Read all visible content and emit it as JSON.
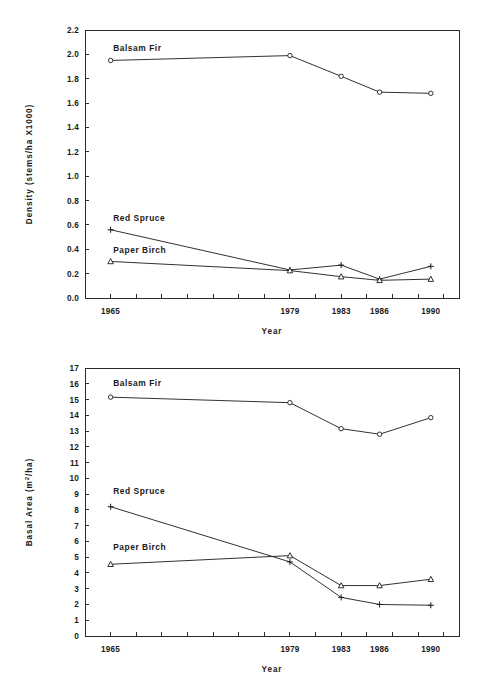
{
  "figures": [
    {
      "id": "density",
      "name": "density-chart",
      "ylabel": "Density (stems/ha X1000)",
      "xlabel": "Year"
    },
    {
      "id": "basal-area",
      "name": "basal-area-chart",
      "ylabel": "Basal Area (m²/ha)",
      "xlabel": "Year"
    }
  ],
  "chart_data": [
    {
      "type": "line",
      "title": "",
      "xlabel": "Year",
      "ylabel": "Density (stems/ha X1000)",
      "categories": [
        "1965",
        "1979",
        "1983",
        "1986",
        "1990"
      ],
      "x_positions": [
        1,
        8,
        10,
        11.5,
        13.5
      ],
      "xlim": [
        0,
        14.6
      ],
      "ylim": [
        0.0,
        2.2
      ],
      "yticks": [
        "0.0",
        "0.2",
        "0.4",
        "0.6",
        "0.8",
        "1.0",
        "1.2",
        "1.4",
        "1.6",
        "1.8",
        "2.0",
        "2.2"
      ],
      "ytick_values": [
        0.0,
        0.2,
        0.4,
        0.6,
        0.8,
        1.0,
        1.2,
        1.4,
        1.6,
        1.8,
        2.0,
        2.2
      ],
      "grid": false,
      "legend_position": "inline-left",
      "series": [
        {
          "name": "Balsam Fir",
          "marker": "circle",
          "values": [
            1.95,
            1.99,
            1.82,
            1.69,
            1.68
          ],
          "label_x": 1.1,
          "label_y": 2.03
        },
        {
          "name": "Red Spruce",
          "marker": "plus",
          "values": [
            0.56,
            0.23,
            0.27,
            0.155,
            0.26
          ],
          "label_x": 1.1,
          "label_y": 0.63
        },
        {
          "name": "Paper Birch",
          "marker": "triangle",
          "values": [
            0.3,
            0.225,
            0.175,
            0.145,
            0.155
          ],
          "label_x": 1.1,
          "label_y": 0.37
        }
      ]
    },
    {
      "type": "line",
      "title": "",
      "xlabel": "Year",
      "ylabel": "Basal Area (m²/ha)",
      "categories": [
        "1965",
        "1979",
        "1983",
        "1986",
        "1990"
      ],
      "x_positions": [
        1,
        8,
        10,
        11.5,
        13.5
      ],
      "xlim": [
        0,
        14.6
      ],
      "ylim": [
        0,
        17
      ],
      "yticks": [
        "0",
        "1",
        "2",
        "3",
        "4",
        "5",
        "6",
        "7",
        "8",
        "9",
        "10",
        "11",
        "12",
        "13",
        "14",
        "15",
        "16",
        "17"
      ],
      "ytick_values": [
        0,
        1,
        2,
        3,
        4,
        5,
        6,
        7,
        8,
        9,
        10,
        11,
        12,
        13,
        14,
        15,
        16,
        17
      ],
      "grid": false,
      "legend_position": "inline-left",
      "series": [
        {
          "name": "Balsam Fir",
          "marker": "circle",
          "values": [
            15.15,
            14.8,
            13.15,
            12.8,
            13.85
          ],
          "label_x": 1.1,
          "label_y": 15.85
        },
        {
          "name": "Red Spruce",
          "marker": "plus",
          "values": [
            8.2,
            4.7,
            2.45,
            2.0,
            1.95
          ],
          "label_x": 1.1,
          "label_y": 9.0
        },
        {
          "name": "Paper Birch",
          "marker": "triangle",
          "values": [
            4.55,
            5.1,
            3.2,
            3.2,
            3.6
          ],
          "label_x": 1.1,
          "label_y": 5.45
        }
      ]
    }
  ]
}
